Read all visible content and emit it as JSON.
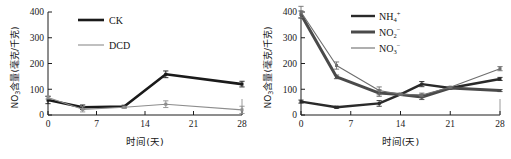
{
  "figure": {
    "panel_count": 2,
    "faint_caption": ""
  },
  "left_panel": {
    "y_axis": {
      "label_prefix": "NO",
      "label_sub": "3",
      "label_suffix": "含量(毫克/千克)",
      "ticks": [
        "0",
        "100",
        "200",
        "300",
        "400"
      ],
      "min": 0,
      "max": 400
    },
    "x_axis": {
      "title": "时间(天)",
      "ticks": [
        "0",
        "7",
        "14",
        "21",
        "28"
      ],
      "min": 0,
      "max": 28
    },
    "legend": [
      {
        "label": "CK",
        "color": "#1a1a1a",
        "width": 2.6
      },
      {
        "label": "DCD",
        "color": "#8d8d8d",
        "width": 1.1
      }
    ]
  },
  "right_panel": {
    "y_axis": {
      "label_prefix": "NO",
      "label_sub": "3",
      "label_suffix": "含量(毫克/千克)",
      "ticks": [
        "0",
        "100",
        "200",
        "300",
        "400"
      ],
      "min": 0,
      "max": 400
    },
    "x_axis": {
      "title": "时间(天)",
      "ticks": [
        "0",
        "7",
        "14",
        "21",
        "28"
      ],
      "min": 0,
      "max": 28
    },
    "legend": [
      {
        "label_prefix": "NH",
        "label_sub": "4",
        "label_sup": "+",
        "color": "#2a2a2a",
        "width": 2.4
      },
      {
        "label_prefix": "NO",
        "label_sub": "2",
        "label_sup": "−",
        "color": "#4a4a4a",
        "width": 3.0
      },
      {
        "label_prefix": "NO",
        "label_sub": "3",
        "label_sup": "−",
        "color": "#6e6e6e",
        "width": 1.1
      }
    ]
  },
  "chart_data": [
    {
      "type": "line",
      "panel": "left",
      "title": "",
      "xlabel": "时间(天)",
      "ylabel": "NO3含量(毫克/千克)",
      "xlim": [
        0,
        28
      ],
      "ylim": [
        0,
        400
      ],
      "xticks": [
        0,
        7,
        14,
        21,
        28
      ],
      "yticks": [
        0,
        100,
        200,
        300,
        400
      ],
      "grid": false,
      "legend_position": "upper-center",
      "x": [
        0,
        5,
        11,
        17,
        28
      ],
      "series": [
        {
          "name": "CK",
          "values": [
            58,
            30,
            33,
            158,
            120
          ],
          "errors": [
            14,
            9,
            5,
            13,
            11
          ],
          "color": "#1a1a1a",
          "linewidth": 2.6
        },
        {
          "name": "DCD",
          "values": [
            68,
            22,
            30,
            42,
            20
          ],
          "errors": [
            6,
            10,
            4,
            13,
            14
          ],
          "color": "#8d8d8d",
          "linewidth": 1.1
        }
      ]
    },
    {
      "type": "line",
      "panel": "right",
      "title": "",
      "xlabel": "时间(天)",
      "ylabel": "NO3含量(毫克/千克)",
      "xlim": [
        0,
        28
      ],
      "ylim": [
        0,
        400
      ],
      "xticks": [
        0,
        7,
        14,
        21,
        28
      ],
      "yticks": [
        0,
        100,
        200,
        300,
        400
      ],
      "grid": false,
      "legend_position": "upper-center",
      "x": [
        0,
        5,
        11,
        14,
        17,
        21,
        28
      ],
      "series": [
        {
          "name": "NH4+",
          "values": [
            52,
            30,
            45,
            80,
            120,
            105,
            140
          ],
          "errors": [
            6,
            4,
            11,
            3,
            10,
            3,
            6
          ],
          "color": "#2a2a2a",
          "linewidth": 2.4
        },
        {
          "name": "NO2-",
          "values": [
            390,
            148,
            85,
            80,
            70,
            105,
            95
          ],
          "errors": [
            14,
            7,
            12,
            4,
            10,
            3,
            4
          ],
          "color": "#4a4a4a",
          "linewidth": 3.0
        },
        {
          "name": "NO3-",
          "values": [
            400,
            192,
            95,
            80,
            78,
            108,
            180
          ],
          "errors": [
            22,
            14,
            14,
            4,
            7,
            3,
            8
          ],
          "color": "#6e6e6e",
          "linewidth": 1.1
        }
      ]
    }
  ]
}
